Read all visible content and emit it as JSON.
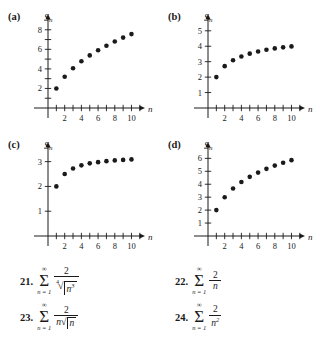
{
  "page": {
    "background": "#ffffff",
    "ink": "#1a1a1a"
  },
  "panels": [
    {
      "id": "a",
      "label": "(a)",
      "ylabel_main": "S",
      "ylabel_sub": "n",
      "xlabel": "n",
      "xticks": [
        2,
        4,
        6,
        8,
        10
      ],
      "yticks": [
        2,
        4,
        6,
        8
      ],
      "ymax": 9.0,
      "xmax": 11.5
    },
    {
      "id": "b",
      "label": "(b)",
      "ylabel_main": "S",
      "ylabel_sub": "n",
      "xlabel": "n",
      "xticks": [
        2,
        4,
        6,
        8,
        10
      ],
      "yticks": [
        1,
        2,
        3,
        4,
        5
      ],
      "ymax": 5.7,
      "xmax": 11.5
    },
    {
      "id": "c",
      "label": "(c)",
      "ylabel_main": "S",
      "ylabel_sub": "n",
      "xlabel": "n",
      "xticks": [
        2,
        4,
        6,
        8,
        10
      ],
      "yticks": [
        1,
        2,
        3
      ],
      "ymax": 3.55,
      "xmax": 11.5
    },
    {
      "id": "d",
      "label": "(d)",
      "ylabel_main": "S",
      "ylabel_sub": "n",
      "xlabel": "n",
      "xticks": [
        2,
        4,
        6,
        8,
        10
      ],
      "yticks": [
        1,
        2,
        3,
        4,
        5,
        6
      ],
      "ymax": 6.8,
      "xmax": 11.5
    }
  ],
  "chart_data": [
    {
      "type": "scatter",
      "panel": "a",
      "title": "(a)",
      "xlabel": "n",
      "ylabel": "S_n",
      "xlim": [
        0,
        11.5
      ],
      "ylim": [
        0,
        9.0
      ],
      "xticks": [
        2,
        4,
        6,
        8,
        10
      ],
      "yticks": [
        2,
        4,
        6,
        8
      ],
      "grid": false,
      "legend": "none",
      "series": [
        {
          "name": "partial sums of 2/n^(3/4)",
          "x": [
            1,
            2,
            3,
            4,
            5,
            6,
            7,
            8,
            9,
            10
          ],
          "values": [
            2.0,
            3.19,
            4.07,
            4.78,
            5.38,
            5.91,
            6.37,
            6.8,
            7.2,
            7.56
          ]
        }
      ]
    },
    {
      "type": "scatter",
      "panel": "b",
      "title": "(b)",
      "xlabel": "n",
      "ylabel": "S_n",
      "xlim": [
        0,
        11.5
      ],
      "ylim": [
        0,
        5.7
      ],
      "xticks": [
        2,
        4,
        6,
        8,
        10
      ],
      "yticks": [
        1,
        2,
        3,
        4,
        5
      ],
      "grid": false,
      "legend": "none",
      "series": [
        {
          "name": "partial sums of 2/(n sqrt(n))",
          "x": [
            1,
            2,
            3,
            4,
            5,
            6,
            7,
            8,
            9,
            10
          ],
          "values": [
            2.0,
            2.71,
            3.09,
            3.34,
            3.52,
            3.66,
            3.77,
            3.86,
            3.93,
            3.99
          ]
        }
      ]
    },
    {
      "type": "scatter",
      "panel": "c",
      "title": "(c)",
      "xlabel": "n",
      "ylabel": "S_n",
      "xlim": [
        0,
        11.5
      ],
      "ylim": [
        0,
        3.55
      ],
      "xticks": [
        2,
        4,
        6,
        8,
        10
      ],
      "yticks": [
        1,
        2,
        3
      ],
      "grid": false,
      "legend": "none",
      "series": [
        {
          "name": "partial sums of 2/n^2",
          "x": [
            1,
            2,
            3,
            4,
            5,
            6,
            7,
            8,
            9,
            10
          ],
          "values": [
            2.0,
            2.5,
            2.72,
            2.85,
            2.93,
            2.98,
            3.02,
            3.05,
            3.07,
            3.09
          ]
        }
      ]
    },
    {
      "type": "scatter",
      "panel": "d",
      "title": "(d)",
      "xlabel": "n",
      "ylabel": "S_n",
      "xlim": [
        0,
        11.5
      ],
      "ylim": [
        0,
        6.8
      ],
      "xticks": [
        2,
        4,
        6,
        8,
        10
      ],
      "yticks": [
        1,
        2,
        3,
        4,
        5,
        6
      ],
      "grid": false,
      "legend": "none",
      "series": [
        {
          "name": "partial sums of 2/n",
          "x": [
            1,
            2,
            3,
            4,
            5,
            6,
            7,
            8,
            9,
            10
          ],
          "values": [
            2.0,
            3.0,
            3.67,
            4.17,
            4.57,
            4.9,
            5.19,
            5.44,
            5.66,
            5.86
          ]
        }
      ]
    }
  ],
  "problems": [
    {
      "number": "21.",
      "sum_top": "∞",
      "sum_bottom": "n = 1",
      "numerator": "2",
      "denominator_kind": "radical",
      "root_index": "4",
      "radicand_base": "n",
      "radicand_exp": "3"
    },
    {
      "number": "22.",
      "sum_top": "∞",
      "sum_bottom": "n = 1",
      "numerator": "2",
      "denominator_kind": "plain",
      "denominator": "n"
    },
    {
      "number": "23.",
      "sum_top": "∞",
      "sum_bottom": "n = 1",
      "numerator": "2",
      "denominator_kind": "n-sqrt",
      "denominator_prefix": "n",
      "radicand_base": "n"
    },
    {
      "number": "24.",
      "sum_top": "∞",
      "sum_bottom": "n = 1",
      "numerator": "2",
      "denominator_kind": "power",
      "denominator_base": "n",
      "denominator_exp": "2"
    }
  ]
}
